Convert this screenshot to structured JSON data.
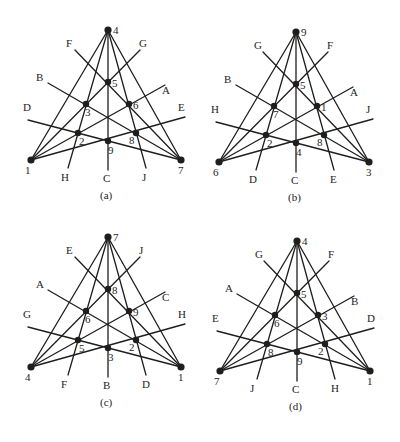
{
  "figure": {
    "geometry": {
      "points": {
        "T": [
          108,
          30
        ],
        "P5": [
          108,
          82
        ],
        "L3": [
          86,
          104
        ],
        "R6": [
          129,
          104
        ],
        "L2": [
          78,
          133
        ],
        "B9": [
          108,
          141
        ],
        "R8": [
          136,
          133
        ],
        "BL": [
          31,
          160
        ],
        "BR": [
          181,
          160
        ]
      },
      "line_ends": {
        "ULhi": [
          75,
          50
        ],
        "URhi": [
          140,
          50
        ],
        "ULmid": [
          48,
          83
        ],
        "URmid": [
          165,
          85
        ],
        "ULlo": [
          28,
          120
        ],
        "URlo": [
          185,
          117
        ],
        "DL": [
          68,
          168
        ],
        "DC": [
          108,
          170
        ],
        "DR": [
          146,
          168
        ]
      },
      "lines": [
        [
          "T",
          "BL"
        ],
        [
          "T",
          "BR"
        ],
        [
          "BR",
          "ULhi"
        ],
        [
          "BL",
          "URhi"
        ],
        [
          "BR",
          "ULmid"
        ],
        [
          "BL",
          "URmid"
        ],
        [
          "BR",
          "ULlo"
        ],
        [
          "BL",
          "URlo"
        ],
        [
          "T",
          "DL"
        ],
        [
          "T",
          "DC"
        ],
        [
          "T",
          "DR"
        ]
      ],
      "point_order": [
        "T",
        "P5",
        "L3",
        "R6",
        "L2",
        "B9",
        "R8",
        "BL",
        "BR"
      ],
      "point_label_offsets": {
        "T": [
          5,
          4
        ],
        "P5": [
          4,
          5
        ],
        "L3": [
          -1,
          12
        ],
        "R6": [
          4,
          5
        ],
        "L2": [
          1,
          12
        ],
        "B9": [
          0,
          13
        ],
        "R8": [
          -7,
          11
        ],
        "BL": [
          -6,
          14
        ],
        "BR": [
          -3,
          14
        ]
      },
      "line_label_pos": {
        "ULhi": [
          66,
          47
        ],
        "URhi": [
          139,
          47
        ],
        "ULmid": [
          36,
          81
        ],
        "URmid": [
          162,
          94
        ],
        "ULlo": [
          23,
          111
        ],
        "URlo": [
          178,
          111
        ],
        "DL": [
          61,
          181
        ],
        "DC": [
          103,
          182
        ],
        "DR": [
          142,
          181
        ]
      },
      "caption_pos": [
        100,
        199
      ]
    },
    "panels": [
      {
        "id": "a",
        "caption": "(a)",
        "offset": [
          0,
          0
        ],
        "point_labels": {
          "T": "4",
          "P5": "5",
          "L3": "3",
          "R6": "6",
          "L2": "2",
          "B9": "9",
          "R8": "8",
          "BL": "1",
          "BR": "7"
        },
        "line_labels": {
          "ULhi": "F",
          "URhi": "G",
          "ULmid": "B",
          "URmid": "A",
          "ULlo": "D",
          "URlo": "E",
          "DL": "H",
          "DC": "C",
          "DR": "J"
        }
      },
      {
        "id": "b",
        "caption": "(b)",
        "offset": [
          188,
          2
        ],
        "point_labels": {
          "T": "9",
          "P5": "5",
          "L3": "7",
          "R6": "1",
          "L2": "2",
          "B9": "4",
          "R8": "8",
          "BL": "6",
          "BR": "3"
        },
        "line_labels": {
          "ULhi": "G",
          "URhi": "F",
          "ULmid": "B",
          "URmid": "A",
          "ULlo": "H",
          "URlo": "J",
          "DL": "D",
          "DC": "C",
          "DR": "E"
        }
      },
      {
        "id": "c",
        "caption": "(c)",
        "offset": [
          0,
          207
        ],
        "point_labels": {
          "T": "7",
          "P5": "8",
          "L3": "6",
          "R6": "9",
          "L2": "5",
          "B9": "3",
          "R8": "2",
          "BL": "4",
          "BR": "1"
        },
        "line_labels": {
          "ULhi": "E",
          "URhi": "J",
          "ULmid": "A",
          "URmid": "C",
          "ULlo": "G",
          "URlo": "H",
          "DL": "F",
          "DC": "B",
          "DR": "D"
        }
      },
      {
        "id": "d",
        "caption": "(d)",
        "offset": [
          189,
          211
        ],
        "point_labels": {
          "T": "4",
          "P5": "5",
          "L3": "6",
          "R6": "3",
          "L2": "8",
          "B9": "9",
          "R8": "2",
          "BL": "7",
          "BR": "1"
        },
        "line_labels": {
          "ULhi": "G",
          "URhi": "F",
          "ULmid": "A",
          "URmid": "B",
          "ULlo": "E",
          "URlo": "D",
          "DL": "J",
          "DC": "C",
          "DR": "H"
        }
      }
    ]
  }
}
